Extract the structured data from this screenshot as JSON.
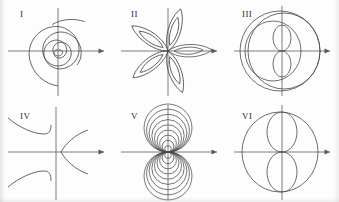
{
  "figure": {
    "background_color": "#fdfdfd",
    "axis_color": "#6e6e6e",
    "curve_color": "#4a4a4a",
    "label_color": "#2b2b2b",
    "rows": 2,
    "columns": 3
  },
  "panels": [
    {
      "label": "I",
      "label_x": 20,
      "label_y": 10,
      "origin_x": 58,
      "origin_y": 51,
      "x_axis_arrow": true,
      "y_axis_arrow": false,
      "curve_kind": "spiral",
      "description": "logarithmic spiral winding outward from the origin, terminating up and to the right",
      "turns": 3.2,
      "start_radius": 3,
      "end_radius": 44
    },
    {
      "label": "II",
      "label_x": 131,
      "label_y": 10,
      "origin_x": 168,
      "origin_y": 51,
      "x_axis_arrow": true,
      "y_axis_arrow": false,
      "curve_kind": "rose",
      "description": "five-petal rose curve with a nested inner petal outline in each lobe",
      "petals": 5,
      "petal_length": 45,
      "petal_width": 15,
      "inner_petal_scale": 0.55,
      "petal_angles_deg": [
        72,
        144,
        216,
        288,
        0
      ]
    },
    {
      "label": "III",
      "label_x": 242,
      "label_y": 10,
      "origin_x": 282,
      "origin_y": 51,
      "x_axis_arrow": true,
      "y_axis_arrow": false,
      "curve_kind": "nested-ovals-with-figure-eight",
      "description": "large outer circle, a shifted inner oval, and a small vertical figure-eight centred on the origin",
      "outer_radius": 40,
      "inner_oval_rx": 28,
      "inner_oval_ry": 30,
      "figure_eight_rx": 9,
      "figure_eight_ry": 13
    },
    {
      "label": "IV",
      "label_x": 20,
      "label_y": 112,
      "origin_x": 58,
      "origin_y": 152,
      "x_axis_arrow": true,
      "y_axis_arrow": false,
      "curve_kind": "hyperbolic-branches",
      "description": "two branches in the left half-plane approaching a vertical asymptote, plus a rightward-opening branch with its vertex near the origin",
      "branches": 3,
      "asymptote_x_offset": -4,
      "right_branch_vertex_x": 16,
      "right_branch_span": 30
    },
    {
      "label": "V",
      "label_x": 131,
      "label_y": 112,
      "origin_x": 168,
      "origin_y": 152,
      "x_axis_arrow": true,
      "y_axis_arrow": false,
      "curve_kind": "nested-tangent-circles",
      "description": "family of nested circles all tangent to the x-axis at the origin, mirrored above and below",
      "loops_per_lobe": 9,
      "max_lobe_radius": 24,
      "min_lobe_radius": 3
    },
    {
      "label": "VI",
      "label_x": 242,
      "label_y": 112,
      "origin_x": 282,
      "origin_y": 152,
      "x_axis_arrow": true,
      "y_axis_arrow": false,
      "curve_kind": "oval-with-vertical-figure-eight",
      "description": "large outer oval with a vertical figure-eight inscribed, the two loops meeting at the origin",
      "outer_rx": 38,
      "outer_ry": 40,
      "lobe_rx": 15,
      "lobe_ry": 20
    }
  ]
}
